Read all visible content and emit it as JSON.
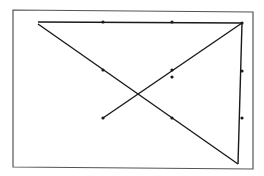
{
  "diagram": {
    "type": "line-drawing",
    "colors": {
      "background": "#ffffff",
      "stroke": "#1a1a1a",
      "frame": "#555555"
    },
    "frame": {
      "points": [
        [
          13,
          10
        ],
        [
          253,
          12
        ],
        [
          253,
          169
        ],
        [
          13,
          167
        ]
      ]
    },
    "segments": [
      {
        "name": "top-edge",
        "from": [
          38,
          22
        ],
        "to": [
          242,
          23
        ]
      },
      {
        "name": "diagonal-up",
        "from": [
          242,
          23
        ],
        "to": [
          103,
          118
        ]
      },
      {
        "name": "diagonal-down",
        "from": [
          38,
          24
        ],
        "to": [
          238,
          164
        ]
      },
      {
        "name": "right-edge",
        "from": [
          238,
          164
        ],
        "to": [
          242,
          23
        ]
      }
    ],
    "dots": [
      [
        103,
        22
      ],
      [
        172,
        22
      ],
      [
        242,
        23
      ],
      [
        103,
        70
      ],
      [
        172,
        70
      ],
      [
        172,
        77
      ],
      [
        103,
        118
      ],
      [
        172,
        118
      ],
      [
        242,
        71
      ],
      [
        242,
        118
      ]
    ]
  }
}
